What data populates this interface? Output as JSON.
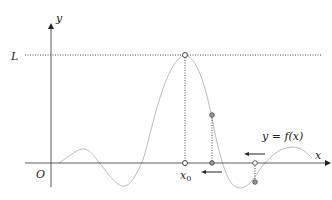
{
  "labels": {
    "y_axis": "y",
    "x_axis": "x",
    "origin": "O",
    "limit": "L",
    "x0": "x",
    "x0_sub": "0",
    "function": "y = f(x)"
  },
  "colors": {
    "axis": "#333333",
    "curve": "#bbbbbb",
    "dotted": "#444444",
    "point_fill": "#ffffff",
    "point_filled": "#888888"
  }
}
